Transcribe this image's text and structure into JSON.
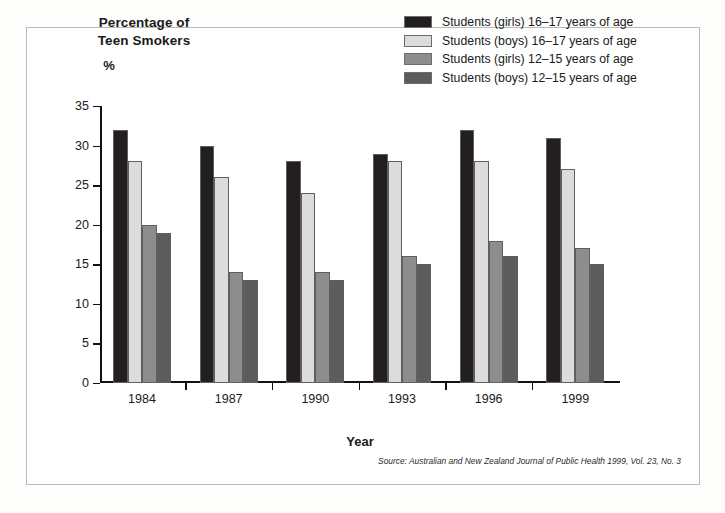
{
  "title": {
    "line1": "Percentage of",
    "line2": "Teen Smokers",
    "unit": "%"
  },
  "source_note": "Source: Australian and New Zealand Journal of Public Health 1999, Vol. 23, No. 3",
  "colors": {
    "series1": "#231f20",
    "series2": "#dcdcda",
    "series3": "#8d8d8d",
    "series4": "#5c5c5c",
    "axis": "#111111",
    "frame": "#b9b9b9",
    "background": "#ffffff"
  },
  "chart_data": {
    "type": "bar",
    "title": "Percentage of Teen Smokers",
    "xlabel": "Year",
    "ylabel": "%",
    "ylim": [
      0,
      35
    ],
    "ytick_step": 5,
    "yticks": [
      "35",
      "30",
      "25",
      "20",
      "15",
      "10",
      "5",
      "0"
    ],
    "grid": false,
    "legend_position": "top-right",
    "categories": [
      "1984",
      "1987",
      "1990",
      "1993",
      "1996",
      "1999"
    ],
    "series": [
      {
        "name": "Students (girls) 16–17 years of age",
        "color": "#231f20",
        "values": [
          32,
          30,
          28,
          29,
          32,
          31
        ]
      },
      {
        "name": "Students (boys) 16–17 years of age",
        "color": "#dcdcda",
        "values": [
          28,
          26,
          24,
          28,
          28,
          27
        ]
      },
      {
        "name": "Students (girls) 12–15 years of age",
        "color": "#8d8d8d",
        "values": [
          20,
          14,
          14,
          16,
          18,
          17
        ]
      },
      {
        "name": "Students (boys) 12–15 years of age",
        "color": "#5c5c5c",
        "values": [
          19,
          13,
          13,
          15,
          16,
          15
        ]
      }
    ]
  }
}
